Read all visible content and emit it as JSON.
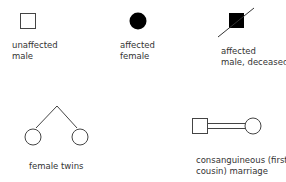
{
  "legend": {
    "items": [
      {
        "symbol": "unaffected-male-square",
        "label_line1": "unaffected",
        "label_line2": "male"
      },
      {
        "symbol": "affected-female-circle",
        "label_line1": "affected",
        "label_line2": "female"
      },
      {
        "symbol": "affected-deceased-male-square",
        "label_line1": "affected",
        "label_line2": "male, deceased"
      },
      {
        "symbol": "female-twins",
        "label_line1": "female twins"
      },
      {
        "symbol": "consanguineous-marriage",
        "label_line1": "consanguineous (first",
        "label_line2": "cousin) marriage"
      }
    ]
  },
  "colors": {
    "stroke": "#444444",
    "fill_affected": "#000000",
    "text": "#333333"
  }
}
